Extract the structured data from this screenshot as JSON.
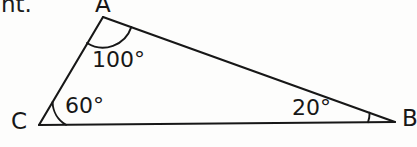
{
  "figure": {
    "kind": "triangle-angle-diagram",
    "background_color": "#fdfdfc",
    "stroke_color": "#171717",
    "partial_text_fragment": "nt.",
    "vertices": [
      {
        "name": "A",
        "label": "A",
        "x": 103,
        "y": 17
      },
      {
        "name": "B",
        "label": "B",
        "x": 395,
        "y": 122
      },
      {
        "name": "C",
        "label": "C",
        "x": 39,
        "y": 125
      }
    ],
    "sides": [
      {
        "name": "side-CA",
        "from": "C",
        "to": "A"
      },
      {
        "name": "side-AB",
        "from": "A",
        "to": "B"
      },
      {
        "name": "side-CB",
        "from": "C",
        "to": "B"
      }
    ],
    "angles": [
      {
        "at": "A",
        "label": "100°",
        "value": 100,
        "unit": "degrees"
      },
      {
        "at": "C",
        "label": "60°",
        "value": 60,
        "unit": "degrees"
      },
      {
        "at": "B",
        "label": "20°",
        "value": 20,
        "unit": "degrees"
      }
    ]
  }
}
